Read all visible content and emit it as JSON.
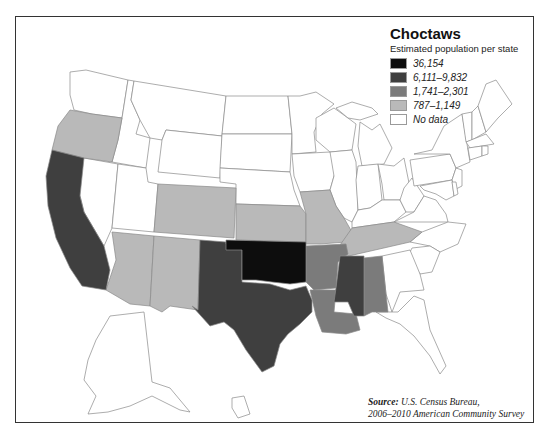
{
  "legend": {
    "title": "Choctaws",
    "subtitle": "Estimated population per state",
    "items": [
      {
        "label": "36,154",
        "color": "#0d0d0d"
      },
      {
        "label": "6,111–9,832",
        "color": "#3f3f3f"
      },
      {
        "label": "1,741–2,301",
        "color": "#7b7b7b"
      },
      {
        "label": "787–1,149",
        "color": "#b9b9b9"
      },
      {
        "label": "No data",
        "color": "#ffffff"
      }
    ]
  },
  "source": {
    "prefix": "Source:",
    "line1": "U.S. Census Bureau,",
    "line2": "2006–2010 American Community Survey"
  },
  "map": {
    "states": {
      "Oklahoma": "36,154",
      "Texas": "6,111–9,832",
      "California": "6,111–9,832",
      "Mississippi": "6,111–9,832",
      "Arkansas": "1,741–2,301",
      "Louisiana": "1,741–2,301",
      "Alabama": "1,741–2,301",
      "Oregon": "787–1,149",
      "Arizona": "787–1,149",
      "New Mexico": "787–1,149",
      "Colorado": "787–1,149",
      "Kansas": "787–1,149",
      "Missouri": "787–1,149",
      "Tennessee": "787–1,149"
    }
  }
}
